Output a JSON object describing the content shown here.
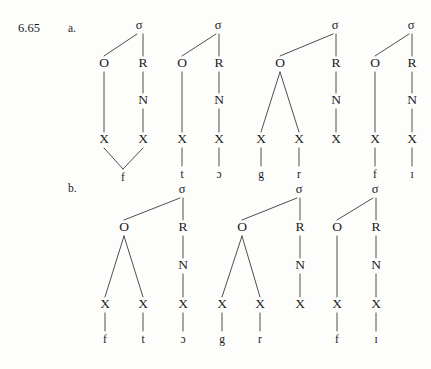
{
  "figure": {
    "number": "6.65",
    "rows": [
      {
        "id": "a",
        "label": "a."
      },
      {
        "id": "b",
        "label": "b."
      }
    ]
  },
  "node_labels": {
    "syllable": "σ",
    "onset": "O",
    "rhyme": "R",
    "nucleus": "N",
    "skeletal_slot": "X"
  },
  "diagram": {
    "type": "syllable-structure-trees",
    "row_a": {
      "label": "a.",
      "trees": [
        {
          "name": "tree-a1",
          "sigma_x": 139,
          "onset": {
            "x": 104,
            "slots": [
              {
                "x": 104,
                "segment": "f",
                "shared": true
              }
            ]
          },
          "rhyme": {
            "x": 143,
            "nucleus": true,
            "slots": [
              {
                "x": 143,
                "segment": "f",
                "shared": true
              }
            ]
          },
          "shared_segment": {
            "x": 123,
            "text": "f"
          },
          "segments": [
            "f"
          ]
        },
        {
          "name": "tree-a2",
          "sigma_x": 218,
          "onset": {
            "x": 182,
            "slots": [
              {
                "x": 182,
                "segment": "t"
              }
            ]
          },
          "rhyme": {
            "x": 219,
            "nucleus": true,
            "slots": [
              {
                "x": 219,
                "segment": "ɔ"
              }
            ]
          },
          "segments": [
            "t",
            "ɔ"
          ]
        },
        {
          "name": "tree-a3",
          "sigma_x": 335,
          "onset": {
            "x": 280,
            "slots": [
              {
                "x": 261,
                "segment": "g"
              },
              {
                "x": 299,
                "segment": "r"
              }
            ]
          },
          "rhyme": {
            "x": 336,
            "nucleus": true,
            "slots": [
              {
                "x": 336,
                "segment": ""
              }
            ]
          },
          "segments": [
            "g",
            "r"
          ]
        },
        {
          "name": "tree-a4",
          "sigma_x": 411,
          "onset": {
            "x": 375,
            "slots": [
              {
                "x": 375,
                "segment": "f"
              }
            ]
          },
          "rhyme": {
            "x": 412,
            "nucleus": true,
            "slots": [
              {
                "x": 412,
                "segment": "ɪ"
              }
            ]
          },
          "segments": [
            "f",
            "ɪ"
          ]
        }
      ]
    },
    "row_b": {
      "label": "b.",
      "trees": [
        {
          "name": "tree-b1",
          "sigma_x": 182,
          "onset": {
            "x": 124,
            "slots": [
              {
                "x": 105,
                "segment": "f"
              },
              {
                "x": 143,
                "segment": "t"
              }
            ]
          },
          "rhyme": {
            "x": 183,
            "nucleus": true,
            "slots": [
              {
                "x": 183,
                "segment": "ɔ"
              }
            ]
          },
          "segments": [
            "f",
            "t",
            "ɔ"
          ]
        },
        {
          "name": "tree-b2",
          "sigma_x": 299,
          "onset": {
            "x": 242,
            "slots": [
              {
                "x": 222,
                "segment": "g"
              },
              {
                "x": 260,
                "segment": "r"
              }
            ]
          },
          "rhyme": {
            "x": 300,
            "nucleus": true,
            "slots": [
              {
                "x": 300,
                "segment": ""
              }
            ]
          },
          "segments": [
            "g",
            "r"
          ]
        },
        {
          "name": "tree-b3",
          "sigma_x": 375,
          "onset": {
            "x": 337,
            "slots": [
              {
                "x": 337,
                "segment": "f"
              }
            ]
          },
          "rhyme": {
            "x": 376,
            "nucleus": true,
            "slots": [
              {
                "x": 376,
                "segment": "ɪ"
              }
            ]
          },
          "segments": [
            "f",
            "ɪ"
          ]
        }
      ]
    }
  },
  "geometry": {
    "row_a": {
      "sigma_y": 26,
      "or_y": 64,
      "n_y": 101,
      "x_y": 140,
      "seg_y": 175,
      "shared_seg_y": 178
    },
    "row_b": {
      "sigma_y": 190,
      "or_y": 228,
      "n_y": 266,
      "x_y": 305,
      "seg_y": 340
    }
  },
  "colors": {
    "background": "#fdfdfc",
    "ink": "#1b1b1b",
    "line": "#3a3a3a"
  }
}
